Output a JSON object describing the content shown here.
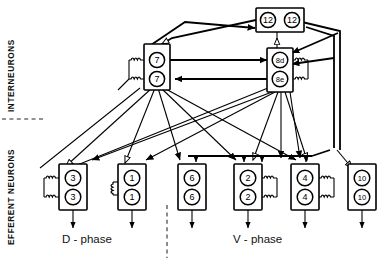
{
  "figure": {
    "background_color": "#ffffff",
    "line_color": "#000000",
    "divider_color": "#6f6f6f"
  },
  "regions": {
    "interneurons_label": "INTERNEURONS",
    "efferent_label": "EFFERENT NEURONS"
  },
  "phases": {
    "left": "D - phase",
    "right": "V - phase"
  },
  "interneurons": [
    {
      "id": "box-12",
      "cells": [
        "12",
        "12"
      ],
      "arrangement": "horizontal",
      "coils": "none"
    },
    {
      "id": "box-7",
      "cells": [
        "7",
        "7"
      ],
      "arrangement": "vertical",
      "coils": "left"
    },
    {
      "id": "box-8",
      "cells": [
        "8d",
        "8e"
      ],
      "arrangement": "vertical",
      "coils": "right"
    }
  ],
  "efferent_neurons": [
    {
      "id": "box-3",
      "cells": [
        "3",
        "3"
      ],
      "coils": "left",
      "phase": "D - phase"
    },
    {
      "id": "box-1",
      "cells": [
        "1",
        "1"
      ],
      "coils": "left",
      "phase": "D - phase"
    },
    {
      "id": "box-6",
      "cells": [
        "6",
        "6"
      ],
      "coils": "none",
      "phase": "V - phase"
    },
    {
      "id": "box-2",
      "cells": [
        "2",
        "2"
      ],
      "coils": "right",
      "phase": "V - phase"
    },
    {
      "id": "box-4",
      "cells": [
        "4",
        "4"
      ],
      "coils": "right",
      "phase": "V - phase"
    },
    {
      "id": "box-10",
      "cells": [
        "10",
        "10"
      ],
      "coils": "none",
      "phase": "V - phase"
    }
  ],
  "legend": {
    "filled_arrow_meaning": "filled-arrowhead-connection",
    "open_arrow_meaning": "open-arrowhead-connection"
  },
  "icons": {
    "coil": "coil-icon",
    "filled_arrow": "filled-arrowhead-icon",
    "open_arrow": "open-arrowhead-icon"
  }
}
